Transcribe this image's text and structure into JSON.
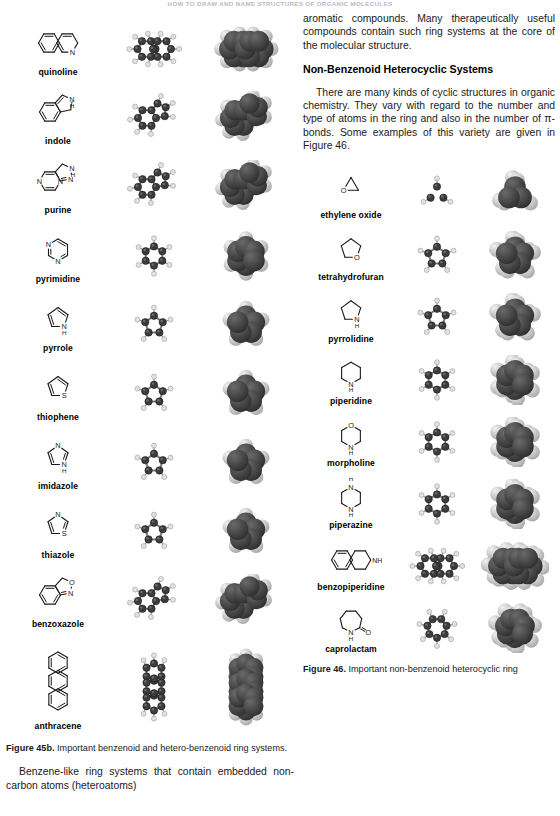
{
  "running_head": "HOW TO DRAW AND NAME STRUCTURES OF ORGANIC MOLECULES",
  "right_column": {
    "para_top": "aromatic compounds. Many therapeutically useful compounds contain such ring systems at the core of the molecular structure.",
    "section_heading": "Non-Benzenoid Heterocyclic Systems",
    "para_intro": "There are many kinds of cyclic structures in organic chemistry. They vary with regard to the number and type of atoms in the ring and also in the number of π-bonds. Some examples of this variety are given in Figure 46.",
    "figure_caption_label": "Figure 46.",
    "figure_caption_text": "Important non-benzenoid heterocyclic ring"
  },
  "left_column": {
    "figure_caption_label": "Figure 45b.",
    "figure_caption_text": "Important benzenoid and hetero-benzenoid ring systems.",
    "para_bottom": "Benzene-like ring systems that contain embedded non-carbon atoms (heteroatoms)"
  },
  "figure_45b": {
    "id": "45b",
    "molecules": [
      {
        "name": "quinoline",
        "ring": "fused-6-6",
        "heteroatoms": [
          "N"
        ],
        "aromatic": true
      },
      {
        "name": "indole",
        "ring": "fused-6-5",
        "heteroatoms": [
          "N",
          "H"
        ],
        "aromatic": true
      },
      {
        "name": "purine",
        "ring": "fused-6-5",
        "heteroatoms": [
          "N",
          "N",
          "N",
          "N",
          "H"
        ],
        "aromatic": true
      },
      {
        "name": "pyrimidine",
        "ring": "6",
        "heteroatoms": [
          "N",
          "N"
        ],
        "aromatic": true
      },
      {
        "name": "pyrrole",
        "ring": "5",
        "heteroatoms": [
          "N",
          "H"
        ],
        "aromatic": true
      },
      {
        "name": "thiophene",
        "ring": "5",
        "heteroatoms": [
          "S"
        ],
        "aromatic": true
      },
      {
        "name": "imidazole",
        "ring": "5",
        "heteroatoms": [
          "N",
          "N",
          "H"
        ],
        "aromatic": true
      },
      {
        "name": "thiazole",
        "ring": "5",
        "heteroatoms": [
          "N",
          "S"
        ],
        "aromatic": true
      },
      {
        "name": "benzoxazole",
        "ring": "fused-6-5",
        "heteroatoms": [
          "N",
          "O"
        ],
        "aromatic": true
      },
      {
        "name": "anthracene",
        "ring": "fused-6-6-6",
        "heteroatoms": [],
        "aromatic": true
      }
    ]
  },
  "figure_46": {
    "id": "46",
    "molecules": [
      {
        "name": "ethylene oxide",
        "ring": "3",
        "heteroatoms": [
          "O"
        ],
        "aromatic": false
      },
      {
        "name": "tetrahydrofuran",
        "ring": "5",
        "heteroatoms": [
          "O"
        ],
        "aromatic": false
      },
      {
        "name": "pyrrolidine",
        "ring": "5",
        "heteroatoms": [
          "N",
          "H"
        ],
        "aromatic": false
      },
      {
        "name": "piperidine",
        "ring": "6",
        "heteroatoms": [
          "N",
          "H"
        ],
        "aromatic": false
      },
      {
        "name": "morpholine",
        "ring": "6",
        "heteroatoms": [
          "O",
          "N",
          "H"
        ],
        "aromatic": false
      },
      {
        "name": "piperazine",
        "ring": "6",
        "heteroatoms": [
          "N",
          "H",
          "N",
          "H"
        ],
        "aromatic": false
      },
      {
        "name": "benzopiperidine",
        "ring": "fused-6-6",
        "heteroatoms": [
          "N",
          "H"
        ],
        "aromatic": false
      },
      {
        "name": "caprolactam",
        "ring": "7",
        "heteroatoms": [
          "N",
          "H",
          "O"
        ],
        "aromatic": false
      }
    ]
  },
  "columns": {
    "col1_label": "skeletal-structure",
    "col2_label": "ball-and-stick-model",
    "col3_label": "space-filling-model"
  },
  "colors": {
    "carbon": "#3c3c3c",
    "hydrogen": "#d8d8d8",
    "heteroatom_dark": "#2a2a2a",
    "heteroatom_light": "#c9c9c9",
    "line": "#1a1a1a",
    "runhead": "#b9b9c4"
  }
}
